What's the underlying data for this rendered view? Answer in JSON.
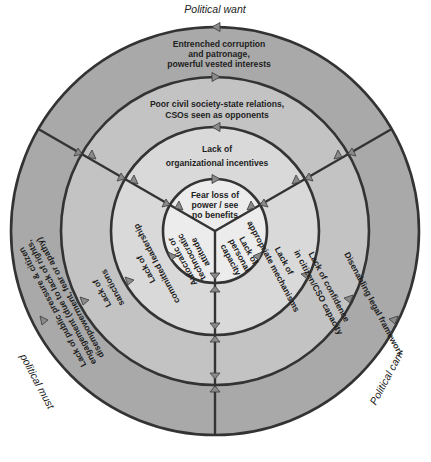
{
  "diagram": {
    "axes": {
      "top": "Political want",
      "right": "Political can",
      "left": "political must"
    },
    "colors": {
      "ring_outer": "#a9a9a9",
      "ring_second": "#c3c3c3",
      "ring_third": "#d9d9d9",
      "ring_inner": "#ececec",
      "line": "#333333",
      "arrow": "#8a8a8a"
    },
    "rings": {
      "outer": {
        "want": [
          "Entrenched corruption",
          "and patronage,",
          "powerful vested interests"
        ],
        "can": "Disenabling legal framework",
        "must": [
          "Lack of public pressure & citizen",
          "engagement (due to lack of rights,",
          "disempowerment, fear or apathy)"
        ]
      },
      "second": {
        "want": [
          "Poor civil society-state relations,",
          "CSOs seen as opponents"
        ],
        "can": [
          "Lack of confidence",
          "in citizen/CSO capacity"
        ],
        "must": [
          "Lack of",
          "sanctions"
        ]
      },
      "third": {
        "want": [
          "Lack of",
          "organizational incentives"
        ],
        "can": [
          "Lack of",
          "appropriate mechanisms"
        ],
        "must": [
          "Lack of",
          "committed leadership"
        ]
      },
      "inner": {
        "want": [
          "Fear loss of",
          "power / see",
          "no benefits"
        ],
        "can": [
          "Lack of",
          "personal",
          "capacity"
        ],
        "must": [
          "Autocratic or",
          "technocratic",
          "attitude"
        ]
      }
    }
  }
}
